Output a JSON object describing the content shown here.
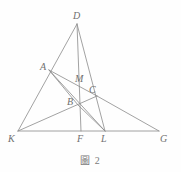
{
  "figure": {
    "caption_label": "圖",
    "caption_number": "2",
    "stroke_color": "#8a8a8a",
    "label_color": "#6f6f6f",
    "background_color": "#fefefe"
  },
  "points": {
    "D": {
      "name": "D",
      "x": 77,
      "y": 24,
      "label_x": 73,
      "label_y": 11
    },
    "A": {
      "name": "A",
      "x": 49,
      "y": 70,
      "label_x": 40,
      "label_y": 62
    },
    "M": {
      "name": "M",
      "x": 82,
      "y": 83,
      "label_x": 75,
      "label_y": 74
    },
    "C": {
      "name": "C",
      "x": 97,
      "y": 96,
      "label_x": 89,
      "label_y": 85
    },
    "B": {
      "name": "B",
      "x": 78,
      "y": 105,
      "label_x": 67,
      "label_y": 97
    },
    "K": {
      "name": "K",
      "x": 18,
      "y": 131,
      "label_x": 8,
      "label_y": 134
    },
    "F": {
      "name": "F",
      "x": 81,
      "y": 131,
      "label_x": 77,
      "label_y": 134
    },
    "L": {
      "name": "L",
      "x": 105,
      "y": 131,
      "label_x": 101,
      "label_y": 134
    },
    "G": {
      "name": "G",
      "x": 159,
      "y": 131,
      "label_x": 160,
      "label_y": 134
    }
  },
  "segments": [
    {
      "name": "segment-K-G",
      "from": "K",
      "to": "G"
    },
    {
      "name": "segment-D-K",
      "from": "D",
      "to": "K"
    },
    {
      "name": "segment-D-F",
      "from": "D",
      "to": "F"
    },
    {
      "name": "segment-D-L",
      "from": "D",
      "to": "L"
    },
    {
      "name": "segment-A-C",
      "from": "A",
      "to": "C"
    },
    {
      "name": "segment-A-L",
      "from": "A",
      "to": "L"
    },
    {
      "name": "segment-K-C",
      "from": "K",
      "to": "C"
    },
    {
      "name": "segment-C-G",
      "from": "C",
      "to": "G"
    },
    {
      "name": "segment-B-L",
      "from": "B",
      "to": "L"
    },
    {
      "name": "segment-A-B",
      "from": "A",
      "to": "B"
    }
  ],
  "labels": [
    {
      "key": "D",
      "text": "D"
    },
    {
      "key": "A",
      "text": "A"
    },
    {
      "key": "M",
      "text": "M"
    },
    {
      "key": "C",
      "text": "C"
    },
    {
      "key": "B",
      "text": "B"
    },
    {
      "key": "K",
      "text": "K"
    },
    {
      "key": "F",
      "text": "F"
    },
    {
      "key": "L",
      "text": "L"
    },
    {
      "key": "G",
      "text": "G"
    }
  ]
}
